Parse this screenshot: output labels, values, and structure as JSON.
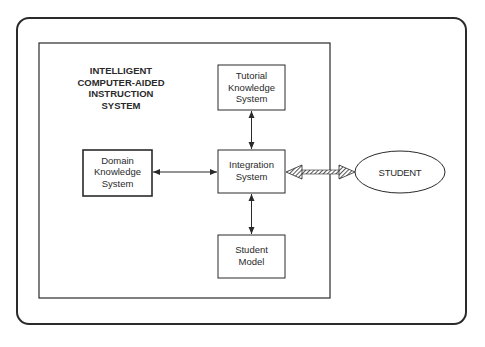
{
  "diagram": {
    "title_lines": [
      "INTELLIGENT",
      "COMPUTER-AIDED",
      "INSTRUCTION",
      "SYSTEM"
    ],
    "nodes": {
      "tutorial": {
        "lines": [
          "Tutorial",
          "Knowledge",
          "System"
        ]
      },
      "domain": {
        "lines": [
          "Domain",
          "Knowledge",
          "System"
        ]
      },
      "integration": {
        "lines": [
          "Integration",
          "System"
        ]
      },
      "student_model": {
        "lines": [
          "Student",
          "Model"
        ]
      },
      "student": {
        "label": "STUDENT"
      }
    },
    "edges": [
      {
        "from": "tutorial",
        "to": "integration",
        "style": "thin-bidirectional"
      },
      {
        "from": "domain",
        "to": "integration",
        "style": "thin-bidirectional"
      },
      {
        "from": "integration",
        "to": "student_model",
        "style": "thin-bidirectional"
      },
      {
        "from": "integration",
        "to": "student",
        "style": "thick-hatched-bidirectional"
      }
    ],
    "colors": {
      "stroke": "#2a2a2a",
      "background": "#ffffff"
    }
  }
}
